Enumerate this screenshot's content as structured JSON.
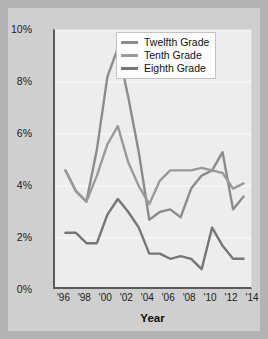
{
  "chart_data": {
    "type": "line",
    "title": "",
    "xlabel": "Year",
    "ylabel": "",
    "xlim": [
      1995,
      2014
    ],
    "ylim": [
      0,
      10
    ],
    "grid": "horizontal",
    "legend_position": "top-center",
    "x_tick_labels": [
      "'96",
      "'98",
      "'00",
      "'02",
      "'04",
      "'06",
      "'08",
      "'10",
      "'12",
      "'14"
    ],
    "x_tick_values": [
      1996,
      1998,
      2000,
      2002,
      2004,
      2006,
      2008,
      2010,
      2012,
      2014
    ],
    "y_tick_labels": [
      "0%",
      "2%",
      "4%",
      "6%",
      "8%",
      "10%"
    ],
    "y_tick_values": [
      0,
      2,
      4,
      6,
      8,
      10
    ],
    "x": [
      1996,
      1997,
      1998,
      1999,
      2000,
      2001,
      2002,
      2003,
      2004,
      2005,
      2006,
      2007,
      2008,
      2009,
      2010,
      2011,
      2012,
      2013
    ],
    "series": [
      {
        "name": "Twelfth Grade",
        "color": "#8c8c8c",
        "values": [
          4.6,
          3.8,
          3.4,
          5.4,
          8.2,
          9.3,
          7.4,
          5.3,
          2.7,
          3.0,
          3.1,
          2.8,
          3.9,
          4.4,
          4.6,
          5.3,
          3.1,
          3.6
        ]
      },
      {
        "name": "Tenth Grade",
        "color": "#9a9a9a",
        "values": [
          4.6,
          3.8,
          3.4,
          4.4,
          5.6,
          6.3,
          4.9,
          4.0,
          3.3,
          4.2,
          4.6,
          4.6,
          4.6,
          4.7,
          4.6,
          4.5,
          3.9,
          4.1
        ]
      },
      {
        "name": "Eighth Grade",
        "color": "#767676",
        "values": [
          2.2,
          2.2,
          1.8,
          1.8,
          2.9,
          3.5,
          3.0,
          2.4,
          1.4,
          1.4,
          1.2,
          1.3,
          1.2,
          0.8,
          2.4,
          1.7,
          1.2,
          1.2
        ]
      }
    ]
  },
  "axis": {
    "y_label_suffix": "%",
    "x_title": "Year"
  },
  "colors": {
    "figure_background": "#b3b3b3",
    "card_background": "#cfcfcf",
    "plot_background": "#ededed",
    "axis_line": "#5a5a5a",
    "gridline": "#f7f7f7",
    "text": "#1a1a1a",
    "legend_background": "#fdfdfd",
    "legend_border": "#c2c2c2"
  }
}
